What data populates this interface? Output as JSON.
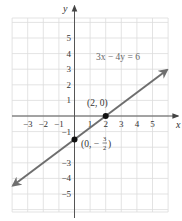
{
  "chart_data": {
    "type": "line",
    "title": "",
    "xlabel": "x",
    "ylabel": "y",
    "xlim": [
      -4,
      6
    ],
    "ylim": [
      -6.2,
      6.2
    ],
    "grid": true,
    "x_tick_labels": [
      "−3",
      "−2",
      "−1",
      "1",
      "2",
      "3",
      "4",
      "5"
    ],
    "x_ticks": [
      -3,
      -2,
      -1,
      1,
      2,
      3,
      4,
      5
    ],
    "y_tick_labels": [
      "5",
      "4",
      "3",
      "2",
      "1",
      "−1",
      "−3",
      "−4",
      "−5"
    ],
    "y_ticks": [
      5,
      4,
      3,
      2,
      1,
      -1,
      -3,
      -4,
      -5
    ],
    "series": [
      {
        "name": "3x − 4y = 6",
        "equation": "3x - 4y = 6",
        "slope": 0.75,
        "intercept": -1.5,
        "x": [
          -3.94,
          5.93
        ],
        "y": [
          -4.455,
          2.9475
        ],
        "arrows": "both"
      }
    ],
    "points": [
      {
        "x": 2,
        "y": 0,
        "label": "(2, 0)"
      },
      {
        "x": 0,
        "y": -1.5,
        "label_prefix": "(0, −",
        "label_num": "3",
        "label_den": "2",
        "label_suffix": ")"
      }
    ],
    "annotations": [
      {
        "text": "3x − 4y = 6",
        "x": 2.9,
        "y": 3.6
      }
    ],
    "colors": {
      "line": "#6e6e6e",
      "grid": "#dcdcdc",
      "axis": "#555555",
      "point": "#111111"
    }
  }
}
